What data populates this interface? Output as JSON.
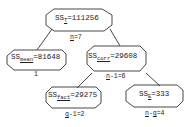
{
  "nodes": {
    "total": {
      "prefix": "SS",
      "sub": "T",
      "value": "=111256",
      "df": "n=7",
      "df_underlined": "n",
      "df_rest": "=7"
    },
    "mean": {
      "prefix": "SS",
      "sub": "mean",
      "value": "=81648",
      "df": "1"
    },
    "corr": {
      "prefix": "SS",
      "sub": "corr",
      "value": "=29608",
      "df_underlined": "n",
      "df_rest": "-1=6"
    },
    "fact": {
      "prefix": "SS",
      "sub": "fact",
      "value": "=29275",
      "df_underlined": "g",
      "df_rest": "-1=2"
    },
    "error": {
      "prefix": "SS",
      "sub": "E",
      "value": "=333",
      "df_underlined": "n",
      "df_mid": "-",
      "df_underlined2": "g",
      "df_rest": "=4"
    }
  }
}
